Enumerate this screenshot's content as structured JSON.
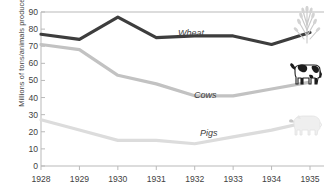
{
  "chart_data": {
    "type": "line",
    "title": "",
    "xlabel": "",
    "ylabel": "Millions of tons/animals produced",
    "categories": [
      "1928",
      "1929",
      "1930",
      "1931",
      "1932",
      "1933",
      "1934",
      "1935"
    ],
    "ylim": [
      0,
      90
    ],
    "yticks": [
      "0",
      "10",
      "20",
      "30",
      "40",
      "50",
      "60",
      "70",
      "80",
      "90"
    ],
    "grid": false,
    "legend_position": "inline-right",
    "series": [
      {
        "name": "Wheat",
        "color": "#3d3d3d",
        "icon": "wheat-sheaf-icon",
        "values": [
          77,
          74,
          87,
          75,
          76,
          76,
          71,
          78
        ]
      },
      {
        "name": "Cows",
        "color": "#c2c2c2",
        "icon": "cow-icon",
        "values": [
          71,
          68,
          53,
          48,
          41,
          41,
          45,
          49
        ]
      },
      {
        "name": "Pigs",
        "color": "#dcdcdc",
        "icon": "pig-icon",
        "values": [
          27,
          21,
          15,
          15,
          13,
          17,
          21,
          26
        ]
      }
    ]
  },
  "labels": {
    "wheat": "Wheat",
    "cows": "Cows",
    "pigs": "Pigs"
  },
  "axis": {
    "y_title": "Millions of tons/animals produced"
  },
  "colors": {
    "wheat_line": "#3d3d3d",
    "cows_line": "#c2c2c2",
    "pigs_line": "#dcdcdc",
    "axis": "#b9b9b9",
    "text": "#3f3f3f",
    "background": "#ffffff"
  }
}
